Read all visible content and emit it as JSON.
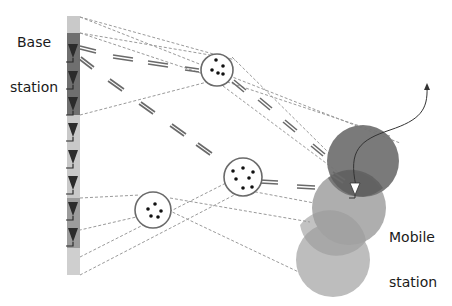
{
  "diagram": {
    "labels": {
      "base_station": [
        "Base",
        "station"
      ],
      "mobile_station": [
        "Mobile",
        "station"
      ]
    },
    "colors": {
      "background": "#ffffff",
      "antenna_array_dark": "#6f6f6f",
      "antenna_array_light": "#c9c9c9",
      "antenna_glyph": "#2b2b2b",
      "scatterer_outline": "#6a6a6a",
      "scatterer_dot": "#111111",
      "dashed_line": "#9a9a9a",
      "multipath_ray": "#6a6a6a",
      "mobile_circle_dark": "#6e6e6e",
      "mobile_circle_mid": "#a9a9a9",
      "mobile_circle_light": "#b9b9b9",
      "trajectory": "#333333"
    },
    "base_station": {
      "antenna_count": 7,
      "panel_segments": [
        "light",
        "dark",
        "light",
        "light"
      ]
    },
    "scatterers": [
      {
        "name": "scatterer-top",
        "dots": 5
      },
      {
        "name": "scatterer-middle",
        "dots": 7
      },
      {
        "name": "scatterer-bottom",
        "dots": 5
      }
    ],
    "mobile_station": {
      "coverage_circles": 3,
      "icon": "antenna-triangle-icon",
      "trajectory": "curved-arrow-icon"
    }
  }
}
